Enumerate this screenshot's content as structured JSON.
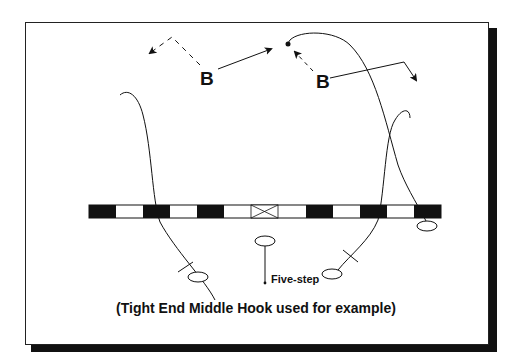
{
  "diagram": {
    "caption": "(Tight End Middle Hook used for example)",
    "defenders": [
      {
        "label": "B",
        "position": "left-linebacker"
      },
      {
        "label": "B",
        "position": "right-linebacker"
      }
    ],
    "annotations": {
      "quarterback_drop": "Five-step"
    },
    "line_of_scrimmage": {
      "blocks": [
        "black",
        "white",
        "black",
        "white",
        "black",
        "white",
        "center-x",
        "white",
        "black",
        "white",
        "black",
        "white",
        "black"
      ]
    },
    "colors": {
      "ink": "#111111",
      "background": "#ffffff",
      "shadow": "#111111"
    }
  }
}
